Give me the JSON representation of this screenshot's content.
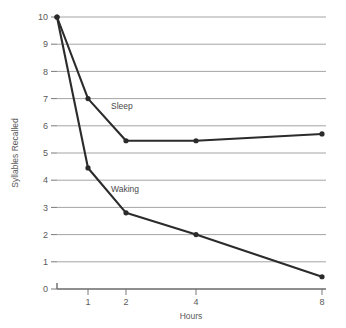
{
  "chart_data": {
    "type": "line",
    "title": "",
    "xlabel": "Hours",
    "ylabel": "Syllables Recalled",
    "x": [
      0,
      1,
      2,
      4,
      8
    ],
    "x_tick_labels": [
      "1",
      "2",
      "4",
      "8"
    ],
    "x_tick_values": [
      1,
      2,
      4,
      8
    ],
    "y_tick_labels": [
      "0",
      "1",
      "2",
      "3",
      "4",
      "5",
      "6",
      "7",
      "8",
      "9",
      "10"
    ],
    "y_tick_values": [
      0,
      1,
      2,
      3,
      4,
      5,
      6,
      7,
      8,
      9,
      10
    ],
    "xlim": [
      0,
      8
    ],
    "ylim": [
      0,
      10
    ],
    "grid": "horizontal",
    "legend_position": "inline-labels",
    "series": [
      {
        "name": "Sleep",
        "values": [
          10,
          7,
          5.45,
          5.45,
          5.7
        ],
        "color": "#2b2b2b",
        "label_x": 2,
        "label_y": 6.6
      },
      {
        "name": "Waking",
        "values": [
          10,
          4.45,
          2.8,
          2.0,
          0.45
        ],
        "color": "#2b2b2b",
        "label_x": 2,
        "label_y": 3.55
      }
    ],
    "colors": {
      "line": "#2b2b2b",
      "grid": "#9a9a9a",
      "axis": "#6a6a6a",
      "text": "#5a5a5a",
      "background": "#ffffff"
    }
  }
}
